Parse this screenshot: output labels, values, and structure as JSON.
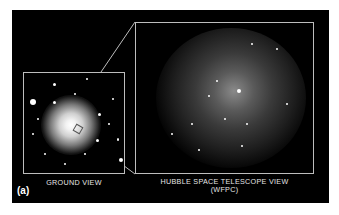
{
  "figure": {
    "panel_tag": "(a)",
    "ground_view": {
      "label": "GROUND VIEW"
    },
    "hst_view": {
      "label_line1": "HUBBLE SPACE TELESCOPE VIEW",
      "label_line2": "(WFPC)"
    },
    "colors": {
      "background": "#000000",
      "frame": "#bdbdbd",
      "text": "#e6e6e6"
    }
  }
}
